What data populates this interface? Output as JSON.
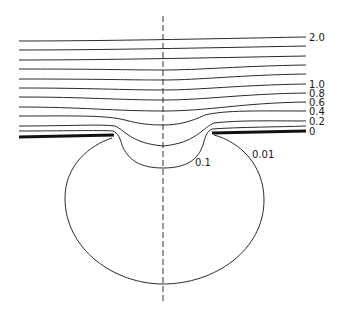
{
  "figure": {
    "type": "equipotential contour diagram",
    "colors": {
      "lines": "#2a2a2a",
      "plate": "#111111",
      "background": "#ffffff"
    }
  },
  "contour_labels": {
    "v2_0": "2.0",
    "v1_0": "1.0",
    "v0_8": "0.8",
    "v0_6": "0.6",
    "v0_4": "0.4",
    "v0_2": "0.2",
    "v0": "0",
    "v0_1": "0.1",
    "v0_01": "0.01"
  },
  "contour_values_top_to_bottom": [
    "2.0",
    "",
    "",
    "",
    "",
    "1.0",
    "0.8",
    "0.6",
    "0.4",
    "0.2",
    "0"
  ],
  "inner_contours": [
    "0.1",
    "0.01"
  ]
}
